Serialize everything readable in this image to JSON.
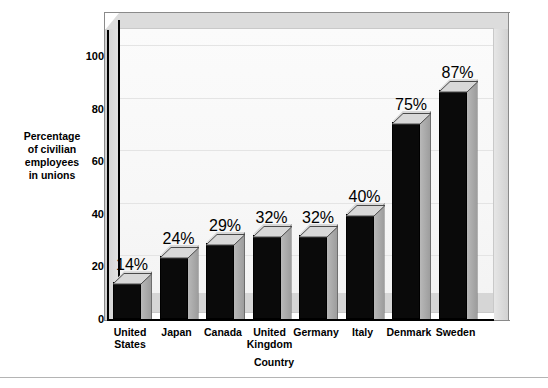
{
  "chart_data": {
    "type": "bar",
    "title": "",
    "xlabel": "Country",
    "ylabel": "Percentage of civilian employees in unions",
    "ylabel_lines": [
      "Percentage",
      "of civilian",
      "employees",
      "in unions"
    ],
    "categories": [
      "United States",
      "Japan",
      "Canada",
      "United Kingdom",
      "Germany",
      "Italy",
      "Denmark",
      "Sweden"
    ],
    "category_lines": [
      [
        "United",
        "States"
      ],
      [
        "Japan"
      ],
      [
        "Canada"
      ],
      [
        "United",
        "Kingdom"
      ],
      [
        "Germany"
      ],
      [
        "Italy"
      ],
      [
        "Denmark"
      ],
      [
        "Sweden"
      ]
    ],
    "values": [
      14,
      24,
      29,
      32,
      32,
      40,
      75,
      87
    ],
    "data_labels": [
      "14%",
      "24%",
      "29%",
      "32%",
      "32%",
      "40%",
      "75%",
      "87%"
    ],
    "ylim": [
      0,
      100
    ],
    "yticks": [
      0,
      20,
      40,
      60,
      80,
      100
    ],
    "ytick_labels": [
      "0",
      "20",
      "40",
      "60",
      "80",
      "100"
    ],
    "grid": true,
    "legend": null,
    "style": "3d-column",
    "colors": {
      "bar_front": "#0a0a0a",
      "bar_top": "#d8d8d8",
      "bar_side": "#a8a8a8",
      "plot_background": "#f7f7f7",
      "frame": "#d2d2d2",
      "gridline": "#e4e4e4",
      "text": "#000000",
      "page_background": "#ffffff"
    }
  }
}
